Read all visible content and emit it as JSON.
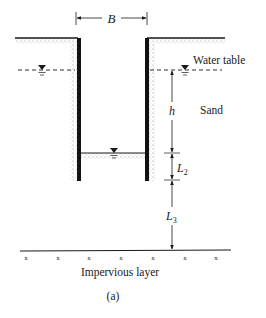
{
  "figure": {
    "caption": "(a)",
    "dimensions": {
      "width_label": "B",
      "head_label": "h",
      "l2_label": "L",
      "l2_sub": "2",
      "l3_label": "L",
      "l3_sub": "3"
    },
    "labels": {
      "water_table": "Water table",
      "soil": "Sand",
      "base": "Impervious layer"
    },
    "symbols": {
      "water_level": "inverted-triangle-water-level-icon",
      "impervious_mark": "x"
    },
    "colors": {
      "ink": "#1a1a1a",
      "wall": "#111111",
      "stipple": "#9a9a9a",
      "background": "#ffffff"
    }
  }
}
